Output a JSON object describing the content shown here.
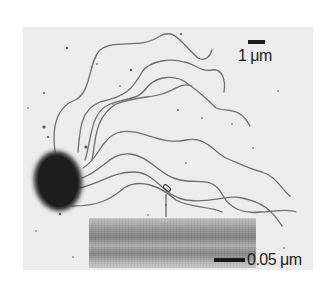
{
  "figure": {
    "scale_bars": {
      "main": {
        "label": "1 μm"
      },
      "inset": {
        "label": "0.05 μm"
      }
    },
    "colors": {
      "background": "#ececec",
      "cell_body": "#2a2a2a",
      "flagella": "#6e6e6e",
      "scale_bar": "#1a1a1a"
    }
  }
}
